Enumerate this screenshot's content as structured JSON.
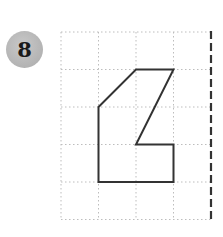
{
  "problem": {
    "number_label": "8"
  },
  "colors": {
    "badge_fill": "#b3b3b3",
    "grid_line": "#b8b8b8",
    "shape_stroke": "#333333",
    "symmetry_axis": "#333333"
  },
  "grid": {
    "columns": 4,
    "rows": 5,
    "cell_size_px": 37.5,
    "origin_px": [
      61,
      32
    ],
    "line_style": "dotted"
  },
  "symmetry_axis": {
    "orientation": "vertical",
    "grid_column": 4,
    "line_style": "dashed"
  },
  "shape": {
    "vertices_grid": [
      [
        1,
        3
      ],
      [
        2,
        2
      ],
      [
        3,
        2
      ],
      [
        2,
        4
      ],
      [
        3,
        4
      ],
      [
        3,
        5
      ],
      [
        1,
        5
      ]
    ],
    "closed": true
  }
}
